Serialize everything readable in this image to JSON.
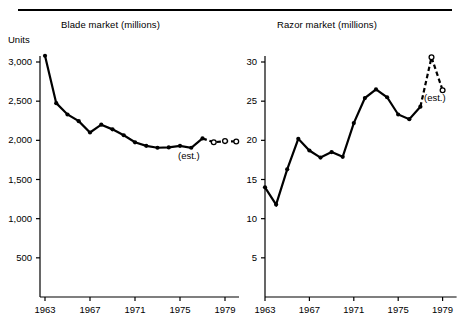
{
  "figure": {
    "units_label": "Units",
    "est_note": "(est.)"
  },
  "panels": {
    "blade": {
      "title": "Blade market (millions)"
    },
    "razor": {
      "title": "Razor market (millions)"
    }
  },
  "chart_data": [
    {
      "type": "line",
      "title": "Blade market (millions)",
      "xlabel": "",
      "ylabel": "Units",
      "xlim": [
        1963,
        1980
      ],
      "ylim": [
        0,
        3200
      ],
      "yticks": [
        500,
        1000,
        1500,
        2000,
        2500,
        3000
      ],
      "ytick_labels": [
        "500",
        "1,000",
        "1,500",
        "2,000",
        "2,500",
        "3,000"
      ],
      "xticks": [
        1963,
        1967,
        1971,
        1975,
        1979
      ],
      "xtick_labels": [
        "1963",
        "1967",
        "1971",
        "1975",
        "1979"
      ],
      "grid": false,
      "legend": null,
      "annotations": [
        {
          "text": "(est.)",
          "x": 1977,
          "y": 1870
        }
      ],
      "series": [
        {
          "name": "Blade market actual",
          "style": "solid",
          "marker": "filled-circle",
          "x": [
            1963,
            1964,
            1965,
            1966,
            1967,
            1968,
            1969,
            1970,
            1971,
            1972,
            1973,
            1974,
            1975,
            1976,
            1977
          ],
          "values": [
            3080,
            2475,
            2330,
            2245,
            2100,
            2200,
            2140,
            2065,
            1975,
            1930,
            1905,
            1910,
            1930,
            1905,
            2025
          ]
        },
        {
          "name": "Blade market estimate",
          "style": "dashed",
          "marker": "open-circle",
          "x": [
            1977,
            1978,
            1979,
            1980
          ],
          "values": [
            2025,
            1975,
            1990,
            1985
          ]
        }
      ]
    },
    {
      "type": "line",
      "title": "Razor market (millions)",
      "xlabel": "",
      "ylabel": "",
      "xlim": [
        1963,
        1980
      ],
      "ylim": [
        0,
        32
      ],
      "yticks": [
        5,
        10,
        15,
        20,
        25,
        30
      ],
      "ytick_labels": [
        "5",
        "10",
        "15",
        "20",
        "25",
        "30"
      ],
      "xticks": [
        1963,
        1967,
        1971,
        1975,
        1979
      ],
      "xtick_labels": [
        "1963",
        "1967",
        "1971",
        "1975",
        "1979"
      ],
      "grid": false,
      "legend": null,
      "annotations": [
        {
          "text": "(est.)",
          "x": 1978,
          "y": 25
        }
      ],
      "series": [
        {
          "name": "Razor market actual",
          "style": "solid",
          "marker": "filled-circle",
          "x": [
            1963,
            1964,
            1965,
            1966,
            1967,
            1968,
            1969,
            1970,
            1971,
            1972,
            1973,
            1974,
            1975,
            1976,
            1977
          ],
          "values": [
            14.0,
            11.8,
            16.3,
            20.2,
            18.7,
            17.8,
            18.5,
            17.9,
            22.2,
            25.4,
            26.5,
            25.5,
            23.3,
            22.7,
            24.3
          ]
        },
        {
          "name": "Razor market estimate",
          "style": "dashed",
          "marker": "open-circle",
          "x": [
            1977,
            1978,
            1979
          ],
          "values": [
            24.3,
            30.6,
            26.4
          ]
        }
      ]
    }
  ]
}
